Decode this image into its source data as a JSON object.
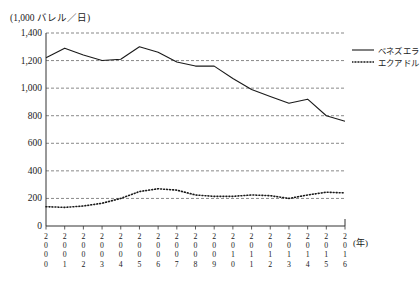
{
  "chart_data": {
    "type": "line",
    "title": "",
    "unit_label": "(1,000 バレル／日)",
    "xlabel": "(年)",
    "ylabel": "",
    "ylim": [
      0,
      1400
    ],
    "yticks": [
      0,
      200,
      400,
      600,
      800,
      1000,
      1200,
      1400
    ],
    "ytick_labels": [
      "0",
      "200",
      "400",
      "600",
      "800",
      "1,000",
      "1,200",
      "1,400"
    ],
    "grid": true,
    "grid_style": "dashed-horizontal",
    "legend_position": "right",
    "categories": [
      "2000",
      "2001",
      "2002",
      "2003",
      "2004",
      "2005",
      "2006",
      "2007",
      "2008",
      "2009",
      "2010",
      "2011",
      "2012",
      "2013",
      "2014",
      "2015",
      "2016"
    ],
    "x": [
      2000,
      2001,
      2002,
      2003,
      2004,
      2005,
      2006,
      2007,
      2008,
      2009,
      2010,
      2011,
      2012,
      2013,
      2014,
      2015,
      2016
    ],
    "series": [
      {
        "name": "ベネズエラ",
        "style": "solid",
        "color": "#1a1a1a",
        "values": [
          1220,
          1290,
          1240,
          1200,
          1210,
          1300,
          1260,
          1190,
          1160,
          1160,
          1070,
          990,
          940,
          890,
          920,
          800,
          760
        ]
      },
      {
        "name": "エクアドル",
        "style": "dotted",
        "color": "#1a1a1a",
        "values": [
          140,
          135,
          145,
          165,
          200,
          250,
          270,
          260,
          225,
          215,
          215,
          225,
          220,
          200,
          225,
          245,
          240
        ]
      }
    ]
  },
  "legend": {
    "items": [
      {
        "label": "ベネズエラ",
        "style": "solid"
      },
      {
        "label": "エクアドル",
        "style": "dotted"
      }
    ]
  },
  "axis": {
    "year_suffix": "(年)"
  }
}
